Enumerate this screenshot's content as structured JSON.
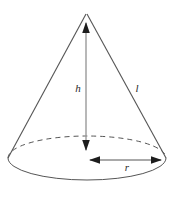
{
  "diagram": {
    "shape": "cone",
    "background_color": "#ffffff",
    "stroke_color": "#555555",
    "height_line_color": "#9a9a9a",
    "label_color": "#2b2b2b",
    "labels": {
      "height": "h",
      "slant": "l",
      "radius": "r"
    },
    "geometry": {
      "apex": {
        "x": 86,
        "y": 12
      },
      "base_center": {
        "x": 87,
        "y": 158
      },
      "base_rx": 79,
      "base_ry": 22,
      "base_left": {
        "x": 8,
        "y": 158
      },
      "base_right": {
        "x": 166,
        "y": 158
      },
      "base_bottom": {
        "x": 87,
        "y": 180
      },
      "base_top_hidden": {
        "x": 87,
        "y": 136
      }
    },
    "elements": {
      "apex_arrow": "arrowhead-up",
      "height_arrow_bottom": "arrowhead-down",
      "radius_arrow_left": "arrowhead-left",
      "radius_arrow_right": "arrowhead-right",
      "back_arc_style": "dashed",
      "front_arc_style": "solid"
    },
    "label_positions": {
      "height": {
        "x": 78,
        "y": 92
      },
      "slant": {
        "x": 135,
        "y": 92
      },
      "radius": {
        "x": 124,
        "y": 171
      }
    }
  }
}
